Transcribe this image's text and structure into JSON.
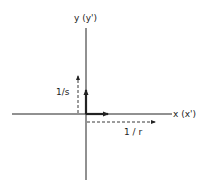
{
  "diagram": {
    "type": "coordinate-axes",
    "labels": {
      "y_axis": "y (y')",
      "x_axis": "x (x')",
      "y_vector": "1/s",
      "x_vector": "1 / r"
    },
    "colors": {
      "line": "#222222",
      "background": "#ffffff"
    }
  }
}
